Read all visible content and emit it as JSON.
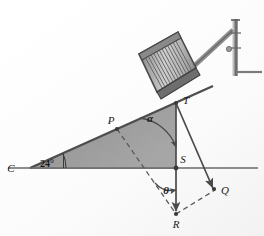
{
  "figure": {
    "type": "geometry-diagram",
    "background_color": "#fefefe",
    "ramp_fill_color": "#9a9a9a",
    "ramp_edge_color": "#4d4d4d",
    "line_color": "#555555",
    "ground_line_color": "#8d8d8d",
    "barrel_color": "#b3b3b3",
    "barrel_stripe_color": "#5d5d5d"
  },
  "labels": {
    "point_c": "C",
    "point_p": "P",
    "point_t": "T",
    "point_s": "S",
    "point_r": "R",
    "point_q": "Q",
    "angle_base": "24°",
    "angle_alpha": "α",
    "angle_theta": "θ"
  },
  "geometry": {
    "incline_angle_deg": 24,
    "ground_line": {
      "x1": 8,
      "y1": 168,
      "x2": 258,
      "y2": 168
    },
    "ramp_apex_c": {
      "x": 30,
      "y": 168
    },
    "ramp_top_t": {
      "x": 176,
      "y": 103
    },
    "point_p": {
      "x": 117,
      "y": 129
    },
    "point_s": {
      "x": 176,
      "y": 168
    },
    "point_r": {
      "x": 176,
      "y": 214
    },
    "point_q": {
      "x": 215,
      "y": 190
    },
    "post_top": {
      "x": 236,
      "y": 19
    },
    "post_bottom": {
      "x": 236,
      "y": 76
    },
    "post_base_right": {
      "x": 262,
      "y": 72
    }
  },
  "annotations": {
    "arc_alpha_label_pos": {
      "x": 150,
      "y": 119
    },
    "arc_theta_label_pos": {
      "x": 166,
      "y": 191
    },
    "base_angle_label_pos": {
      "x": 47,
      "y": 166
    }
  }
}
